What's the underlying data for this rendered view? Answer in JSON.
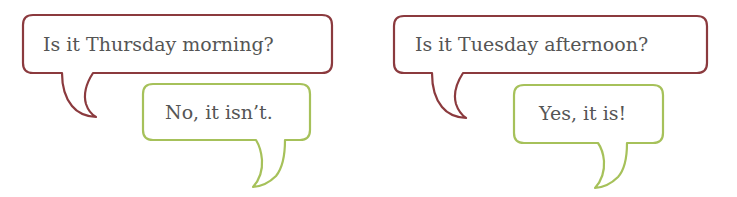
{
  "colors": {
    "question_border": "#8b3a3e",
    "answer_border": "#a6c15a",
    "text": "#555555",
    "background": "#ffffff"
  },
  "dialogues": [
    {
      "question": "Is it Thursday morning?",
      "answer": "No, it isn’t."
    },
    {
      "question": "Is it Tuesday afternoon?",
      "answer": "Yes, it is!"
    }
  ]
}
